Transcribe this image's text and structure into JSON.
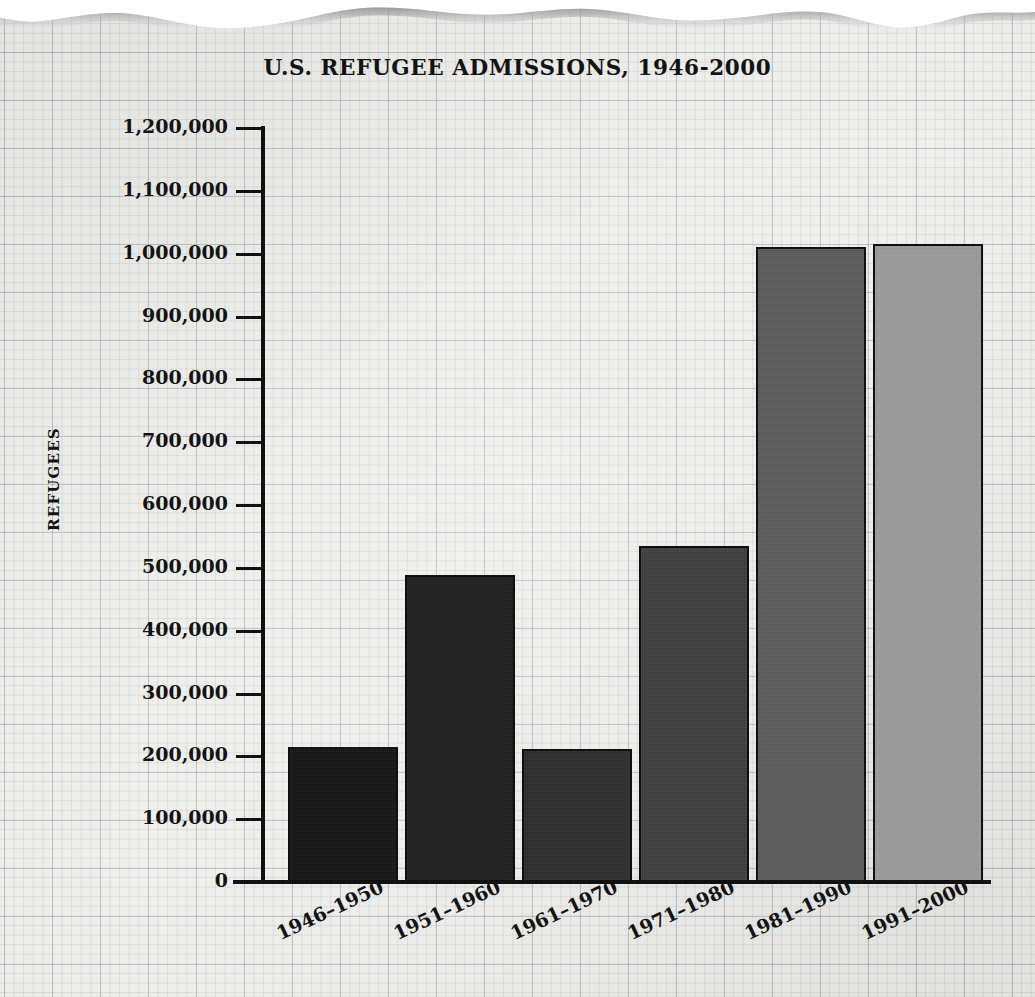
{
  "chart_data": {
    "type": "bar",
    "title": "U.S. REFUGEE ADMISSIONS, 1946-2000",
    "xlabel": "",
    "ylabel": "REFUGEES",
    "categories": [
      "1946–1950",
      "1951–1960",
      "1961–1970",
      "1971–1980",
      "1981–1990",
      "1991–2000"
    ],
    "values": [
      215000,
      489000,
      212000,
      535000,
      1010000,
      1016000
    ],
    "ylim": [
      0,
      1200000
    ],
    "ytick_values": [
      0,
      100000,
      200000,
      300000,
      400000,
      500000,
      600000,
      700000,
      800000,
      900000,
      1000000,
      1100000,
      1200000
    ],
    "ytick_labels": [
      "0",
      "100,000",
      "200,000",
      "300,000",
      "400,000",
      "500,000",
      "600,000",
      "700,000",
      "800,000",
      "900,000",
      "1,000,000",
      "1,100,000",
      "1,200,000"
    ],
    "bar_colors": [
      "#151515",
      "#1f1f1f",
      "#2d2d2d",
      "#3f3f3f",
      "#5c5c5c",
      "#9c9c9c"
    ],
    "bar_edge_color": "#101010",
    "grid": true,
    "grid_style": "graph-paper",
    "legend": "none",
    "background": "#f4f4f0",
    "xtick_rotation": -25
  },
  "page": {
    "paper_edge": "torn-top-edge"
  }
}
